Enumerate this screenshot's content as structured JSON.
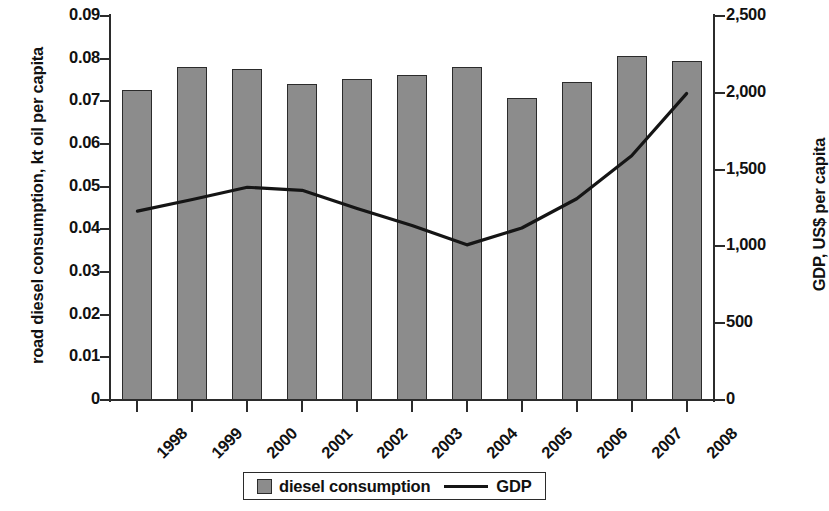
{
  "chart_data": {
    "type": "bar",
    "title": "",
    "subtitle": "",
    "xlabel": "",
    "ylabel": "road diesel consumption, kt oil per capita",
    "y2label": "GDP, US$ per capita",
    "grid": false,
    "legend_position": "bottom",
    "categories": [
      "1998",
      "1999",
      "2000",
      "2001",
      "2002",
      "2003",
      "2004",
      "2005",
      "2006",
      "2007",
      "2008"
    ],
    "ylim": [
      0,
      0.09
    ],
    "yticks": [
      "0.09",
      "0.08",
      "0.07",
      "0.06",
      "0.05",
      "0.04",
      "0.03",
      "0.02",
      "0.01",
      "0"
    ],
    "ytick_values": [
      0.09,
      0.08,
      0.07,
      0.06,
      0.05,
      0.04,
      0.03,
      0.02,
      0.01,
      0
    ],
    "y2lim": [
      0,
      2500
    ],
    "y2ticks": [
      "2,500",
      "2,000",
      "1,500",
      "1,000",
      "500",
      "0"
    ],
    "y2tick_values": [
      2500,
      2000,
      1500,
      1000,
      500,
      0
    ],
    "series": [
      {
        "name": "diesel consumption",
        "type": "bar",
        "axis": "left",
        "color": "#8c8c8c",
        "edge_color": "#2b2b2b",
        "values": [
          0.0726,
          0.078,
          0.0776,
          0.074,
          0.0752,
          0.0761,
          0.0781,
          0.0707,
          0.0746,
          0.0807,
          0.0795
        ]
      },
      {
        "name": "GDP",
        "type": "line",
        "axis": "right",
        "color": "#151515",
        "values": [
          1230,
          1305,
          1385,
          1365,
          1247,
          1136,
          1010,
          1120,
          1310,
          1590,
          1995
        ]
      }
    ]
  },
  "legend": {
    "items": [
      {
        "label": "diesel  consumption",
        "marker": "square-swatch"
      },
      {
        "label": "GDP",
        "marker": "line-swatch"
      }
    ]
  }
}
